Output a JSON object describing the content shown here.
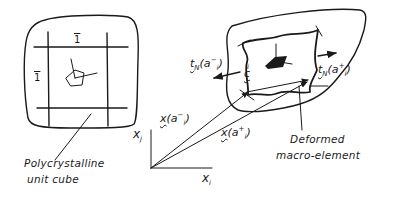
{
  "diagram": {
    "left_panel": {
      "caption_line1": "Polycrystalline",
      "caption_line2": "unit cube",
      "top_label": "1",
      "left_label": "1"
    },
    "right_panel": {
      "caption_line1": "Deformed",
      "caption_line2": "macro-element",
      "traction_left": {
        "symbol": "t",
        "subscript": "N",
        "argument": "(a",
        "arg_sub": "i",
        "arg_sup": "−",
        "close": ")"
      },
      "traction_right": {
        "symbol": "t",
        "subscript": "N",
        "argument": "(a",
        "arg_sub": "i",
        "arg_sup": "+",
        "close": ")"
      },
      "vector_c": {
        "symbol": "c",
        "superscript": "i"
      }
    },
    "coordinate_system": {
      "vertical_axis": "x",
      "vertical_axis_sub": "j",
      "horizontal_axis": "x",
      "horizontal_axis_sub": "i",
      "position_minus": {
        "symbol": "x",
        "argument": "(a",
        "arg_sub": "i",
        "arg_sup": "−",
        "close": ")"
      },
      "position_plus": {
        "symbol": "x",
        "argument": "(a",
        "arg_sub": "i",
        "arg_sup": "+",
        "close": ")"
      }
    },
    "colors": {
      "ink": "#1a1a1a",
      "background": "#ffffff"
    }
  }
}
